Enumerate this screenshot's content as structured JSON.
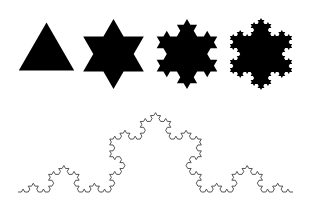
{
  "figure": {
    "background": "#ffffff",
    "fill_color": "#000000",
    "curve_color": "#444444",
    "snowflakes": [
      {
        "name": "koch-iteration-0",
        "level": 0,
        "cx": 46.5,
        "cy": 54.5,
        "r": 32
      },
      {
        "name": "koch-iteration-1",
        "level": 1,
        "cx": 113.5,
        "cy": 54,
        "r": 35
      },
      {
        "name": "koch-iteration-2",
        "level": 2,
        "cx": 187,
        "cy": 54,
        "r": 35
      },
      {
        "name": "koch-iteration-3",
        "level": 3,
        "cx": 261,
        "cy": 54,
        "r": 36
      }
    ],
    "curve": {
      "name": "koch-curve",
      "level": 4,
      "start": [
        18,
        192
      ],
      "end": [
        293,
        192
      ],
      "stroke_width": 0.9
    }
  }
}
